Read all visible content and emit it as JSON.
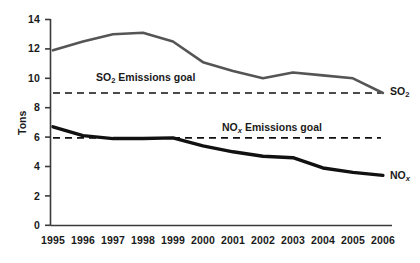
{
  "chart_data": {
    "type": "line",
    "title": "",
    "xlabel": "",
    "ylabel": "Tons",
    "categories": [
      "1995",
      "1996",
      "1997",
      "1998",
      "1999",
      "2000",
      "2001",
      "2002",
      "2003",
      "2004",
      "2005",
      "2006"
    ],
    "xlim": [
      1995,
      2006
    ],
    "ylim": [
      0,
      14
    ],
    "yticks": [
      0,
      2,
      4,
      6,
      8,
      10,
      12,
      14
    ],
    "grid": false,
    "legend_position": "line-end-labels",
    "series": [
      {
        "name": "SO2",
        "label": "SO",
        "label_sub": "2",
        "color": "#555555",
        "style": "solid",
        "width": 2.6,
        "values": [
          11.9,
          12.5,
          13.0,
          13.1,
          12.5,
          11.1,
          10.5,
          10.0,
          10.4,
          10.2,
          10.0,
          9.0
        ]
      },
      {
        "name": "NOx",
        "label": "NO",
        "label_sub": "x",
        "color": "#111111",
        "style": "solid",
        "width": 3.4,
        "values": [
          6.7,
          6.1,
          5.9,
          5.9,
          5.95,
          5.4,
          5.0,
          4.7,
          4.6,
          3.9,
          3.6,
          3.4
        ]
      }
    ],
    "reference_lines": [
      {
        "name": "so2-goal",
        "value": 9.0,
        "style": "dashed",
        "color": "#111111",
        "annotation": "SO2 Emissions goal",
        "annotation_main": "SO",
        "annotation_sub": "2",
        "annotation_tail": " Emissions goal"
      },
      {
        "name": "nox-goal",
        "value": 5.95,
        "style": "dashed",
        "color": "#111111",
        "annotation": "NOx Emissions goal",
        "annotation_main": "NO",
        "annotation_sub": "x",
        "annotation_tail": " Emissions goal"
      }
    ]
  },
  "axes": {
    "y_label": "Tons",
    "y_tick_labels": [
      "14",
      "12",
      "10",
      "8",
      "6",
      "4",
      "2",
      "0"
    ],
    "x_tick_labels": [
      "1995",
      "1996",
      "1997",
      "1998",
      "1999",
      "2000",
      "2001",
      "2002",
      "2003",
      "2004",
      "2005",
      "2006"
    ]
  },
  "annotations": {
    "so2_goal_main": "SO",
    "so2_goal_sub": "2",
    "so2_goal_tail": " Emissions goal",
    "nox_goal_main": "NO",
    "nox_goal_sub": "x",
    "nox_goal_tail": " Emissions goal"
  },
  "series_end_labels": {
    "so2_main": "SO",
    "so2_sub": "2",
    "nox_main": "NO",
    "nox_sub": "x"
  }
}
